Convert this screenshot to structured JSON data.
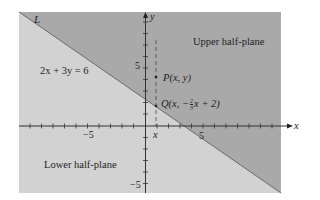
{
  "diagram": {
    "line_label": "L",
    "equation": "2x + 3y = 6",
    "upper_region_label": "Upper half-plane",
    "lower_region_label": "Lower half-plane",
    "point_p_label": "P(x, y)",
    "point_q_label_prefix": "Q",
    "point_q_label": "(x, −",
    "point_q_frac_num": "2",
    "point_q_frac_den": "3",
    "point_q_label_suffix": "x + 2)",
    "x_axis_label": "x",
    "y_axis_label": "y",
    "x_marker_label": "x",
    "tick_labels": {
      "x_neg5": "−5",
      "x_pos5": "5",
      "y_pos5": "5",
      "y_neg5": "−5"
    },
    "colors": {
      "upper_fill": "#a9a9a9",
      "lower_fill": "#d2d2d2",
      "axis": "#333333",
      "background": "#ffffff"
    }
  }
}
